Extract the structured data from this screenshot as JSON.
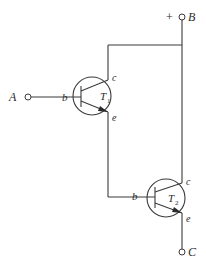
{
  "diagram": {
    "type": "darlington-pair-circuit",
    "terminals": {
      "A": {
        "label": "A"
      },
      "B": {
        "label": "B",
        "polarity": "+"
      },
      "C": {
        "label": "C"
      }
    },
    "transistors": [
      {
        "id": "T1",
        "name": "T",
        "subscript": "1",
        "pins": {
          "base": "b",
          "collector": "c",
          "emitter": "e"
        }
      },
      {
        "id": "T2",
        "name": "T",
        "subscript": "2",
        "pins": {
          "base": "b",
          "collector": "c",
          "emitter": "e"
        }
      }
    ],
    "connections": [
      "A -> T1.base",
      "B -> T1.collector",
      "B -> T2.collector",
      "T1.emitter -> T2.base",
      "T2.emitter -> C"
    ],
    "colors": {
      "line": "#3a3a3a",
      "background": "#ffffff"
    }
  }
}
